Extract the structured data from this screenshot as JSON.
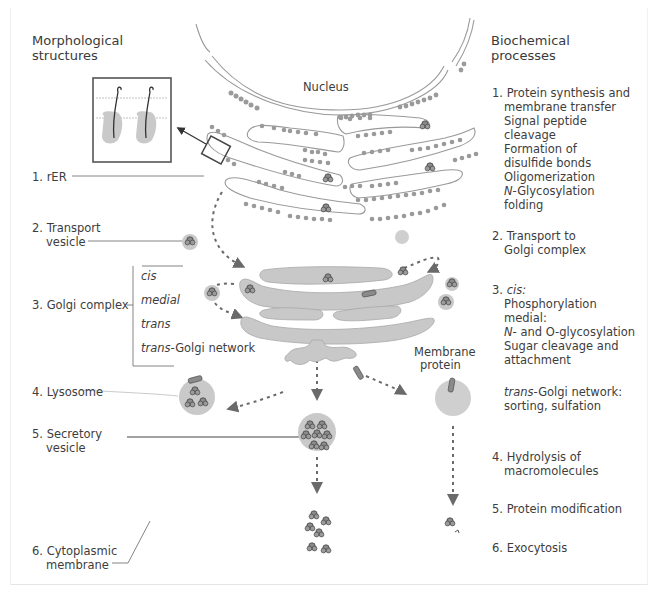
{
  "left_header": {
    "line1": "Morphological",
    "line2": "structures"
  },
  "right_header": {
    "line1": "Biochemical",
    "line2": "processes"
  },
  "nucleus_label": "Nucleus",
  "membrane_protein_label": {
    "line1": "Membrane",
    "line2": "protein"
  },
  "structures": [
    {
      "num": "1.",
      "label": "rER"
    },
    {
      "num": "2.",
      "label_line1": "Transport",
      "label_line2": "vesicle"
    },
    {
      "num": "3.",
      "label": "Golgi complex",
      "sublabels": [
        "cis",
        "medial",
        "trans",
        "trans",
        "-Golgi network"
      ]
    },
    {
      "num": "4.",
      "label": "Lysosome"
    },
    {
      "num": "5.",
      "label_line1": "Secretory",
      "label_line2": "vesicle"
    },
    {
      "num": "6.",
      "label_line1": "Cytoplasmic",
      "label_line2": "membrane"
    }
  ],
  "processes": [
    {
      "num": "1.",
      "lines": [
        "Protein synthesis and",
        "membrane transfer",
        "Signal peptide",
        "cleavage",
        "Formation of",
        "disulfide bonds",
        "Oligomerization",
        "N",
        "-Glycosylation",
        "folding"
      ]
    },
    {
      "num": "2.",
      "lines": [
        "Transport to",
        "Golgi complex"
      ]
    },
    {
      "num": "3.",
      "lines": [
        "cis:",
        "Phosphorylation",
        "medial:",
        "N",
        "- and O-glycosylation",
        "Sugar cleavage and",
        "attachment"
      ]
    },
    {
      "num": "3b",
      "lines": [
        "trans",
        "-Golgi network:",
        "sorting, sulfation"
      ]
    },
    {
      "num": "4.",
      "lines": [
        "Hydrolysis of",
        "macromolecules"
      ]
    },
    {
      "num": "5.",
      "lines": [
        "Protein modification"
      ]
    },
    {
      "num": "6.",
      "lines": [
        "Exocytosis"
      ]
    }
  ],
  "colors": {
    "organelle_fill": "#c8c8c8",
    "ribosome": "#9a9a9a",
    "line": "#555555",
    "text": "#3d3d3d",
    "arrow": "#6a6a6a"
  }
}
